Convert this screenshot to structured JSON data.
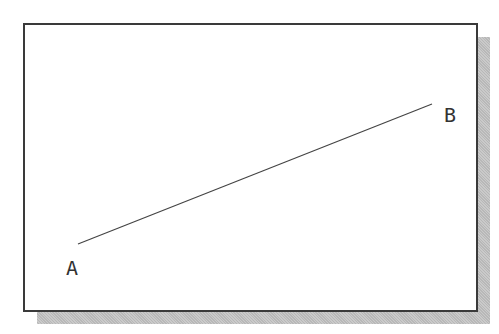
{
  "diagram": {
    "points": [
      {
        "label": "A",
        "x": 78,
        "y": 244,
        "label_x": 66,
        "label_y": 258
      },
      {
        "label": "B",
        "x": 432,
        "y": 104,
        "label_x": 444,
        "label_y": 105
      }
    ],
    "segment": {
      "from": "A",
      "to": "B"
    },
    "colors": {
      "line": "#444444",
      "frame": "#3a3a3a",
      "shadow": "#b8b8b8",
      "background": "#ffffff"
    }
  }
}
